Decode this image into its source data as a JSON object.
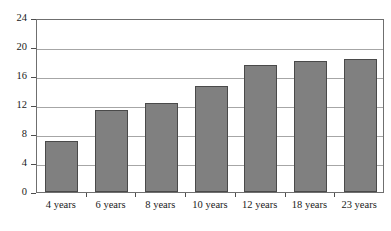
{
  "chart_data": {
    "type": "bar",
    "title": "",
    "xlabel": "",
    "ylabel": "",
    "categories": [
      "4 years",
      "6 years",
      "8 years",
      "10 years",
      "12 years",
      "18 years",
      "23 years"
    ],
    "values": [
      7.1,
      11.3,
      12.3,
      14.6,
      17.5,
      18.1,
      18.3
    ],
    "ylim": [
      0,
      24
    ],
    "yticks": [
      0,
      4,
      8,
      12,
      16,
      20,
      24
    ],
    "ytick_labels": [
      "0",
      "4",
      "8",
      "12",
      "16",
      "20",
      "24"
    ],
    "grid": true,
    "legend": "none",
    "colors": {
      "bar_fill": "#808080",
      "bar_stroke": "#4a4a4a",
      "gridline": "#a6a6a6",
      "axis": "#6f6f6f",
      "text": "#1a1a1a",
      "background": "#ffffff"
    }
  }
}
